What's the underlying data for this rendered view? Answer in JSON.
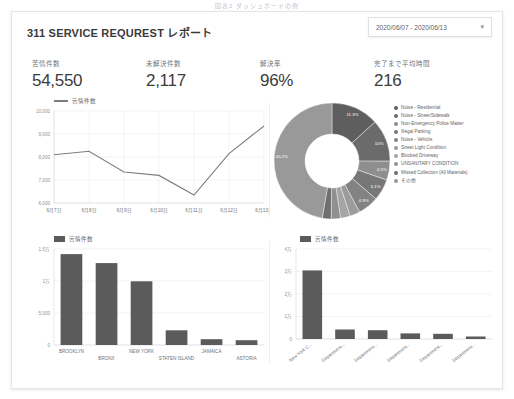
{
  "caption": "図表2  ダッシュボードの例",
  "header": {
    "title": "311 SERVICE REQUREST レポート",
    "date_range": "2020/06/07 - 2020/06/13",
    "caret": "▾"
  },
  "kpis": [
    {
      "label": "苦情件数",
      "value": "54,550"
    },
    {
      "label": "未解決件数",
      "value": "2,117"
    },
    {
      "label": "解決率",
      "value": "96%"
    },
    {
      "label": "完了まで平均時間",
      "value": "216"
    }
  ],
  "series_legend_label": "苦情件数",
  "chart_data": [
    {
      "type": "line",
      "title": "",
      "legend": [
        "苦情件数"
      ],
      "xlabel": "",
      "ylabel": "",
      "categories": [
        "6月7日",
        "6月8日",
        "6月9日",
        "6月10日",
        "6月11日",
        "6月12日",
        "6月13日"
      ],
      "values": [
        8100,
        8250,
        7350,
        7200,
        6350,
        8150,
        9350
      ],
      "ylim": [
        6000,
        10000
      ],
      "yticks": [
        "6,000",
        "7,000",
        "8,000",
        "9,000",
        "10,000"
      ],
      "ytick_values": [
        6000,
        7000,
        8000,
        9000,
        10000
      ],
      "grid": true,
      "legend_position": "top-left",
      "color": "#7d7d7d"
    },
    {
      "type": "pie",
      "variant": "donut",
      "title": "",
      "labels": [
        "Noise - Residential",
        "Noise - Street/Sidewalk",
        "Non-Emergency Police Matter",
        "Illegal Parking",
        "Noise - Vehicle",
        "Street Light Condition",
        "Blocked Driveway",
        "UNSANITARY CONDITION",
        "Missed Collection (All Materials)",
        "その他"
      ],
      "values": [
        11.3,
        10.0,
        4.5,
        5.1,
        4.9,
        2.4,
        2.3,
        2.2,
        2.1,
        40.2
      ],
      "value_labels": [
        "11.3%",
        "10%",
        "4.5%",
        "5.1%",
        "4.9%",
        "",
        "",
        "",
        "",
        "40.2%"
      ],
      "colors": [
        "#5e5e5e",
        "#6b6b6b",
        "#8e8e8e",
        "#777777",
        "#838383",
        "#9b9b9b",
        "#a5a5a5",
        "#909090",
        "#6f6f6f",
        "#999999"
      ],
      "legend_position": "right"
    },
    {
      "type": "bar",
      "title": "",
      "legend": [
        "苦情件数"
      ],
      "categories": [
        "BROOKLYN",
        "BRONX",
        "NEW YORK",
        "STATEN ISLAND",
        "JAMAICA",
        "ASTORIA"
      ],
      "values": [
        14200,
        12800,
        9950,
        2300,
        900,
        750
      ],
      "ylim": [
        0,
        15000
      ],
      "yticks": [
        "0",
        "5,000",
        "1万",
        "1.5万"
      ],
      "ytick_values": [
        0,
        5000,
        10000,
        15000
      ],
      "grid": true,
      "color": "#5b5b5b",
      "legend_position": "top-left"
    },
    {
      "type": "bar",
      "title": "",
      "legend": [
        "苦情件数"
      ],
      "categories": [
        "New York C...",
        "Department...",
        "Department...",
        "Department...",
        "Department...",
        "Department..."
      ],
      "values": [
        30500,
        4200,
        3900,
        2500,
        2300,
        1100
      ],
      "ylim": [
        0,
        40000
      ],
      "yticks": [
        "0",
        "1万",
        "2万",
        "3万",
        "4万"
      ],
      "ytick_values": [
        0,
        10000,
        20000,
        30000,
        40000
      ],
      "grid": true,
      "color": "#5b5b5b",
      "legend_position": "top-left"
    }
  ]
}
